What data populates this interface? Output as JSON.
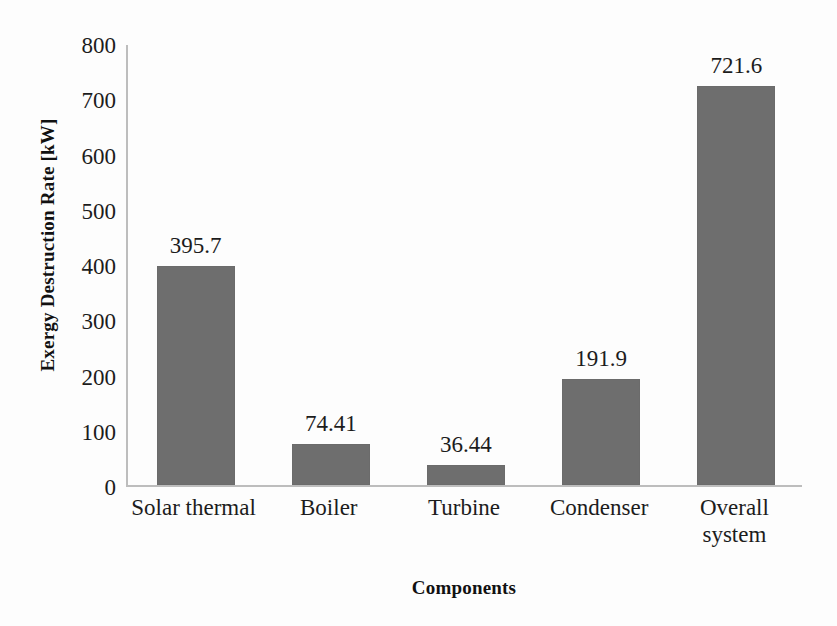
{
  "chart_data": {
    "type": "bar",
    "title": "",
    "subtitle": "",
    "xlabel": "Components",
    "ylabel": "Exergy Destruction Rate [kW]",
    "categories": [
      "Solar thermal",
      "Boiler",
      "Turbine",
      "Condenser",
      "Overall system"
    ],
    "values": [
      395.7,
      74.41,
      36.44,
      191.9,
      721.6
    ],
    "value_labels": [
      "395.7",
      "74.41",
      "36.44",
      "191.9",
      "721.6"
    ],
    "series": [
      {
        "name": "Exergy Destruction Rate",
        "values": [
          395.7,
          74.41,
          36.44,
          191.9,
          721.6
        ]
      }
    ],
    "ylim": [
      0,
      800
    ],
    "ytick_values": [
      800,
      700,
      600,
      500,
      400,
      300,
      200,
      100,
      0
    ],
    "ytick_labels": [
      "800",
      "700",
      "600",
      "500",
      "400",
      "300",
      "200",
      "100",
      "0"
    ],
    "grid": false,
    "legend": false,
    "legend_position": "none",
    "bar_color": "#6e6e6e",
    "axis_color": "#bdbdbd",
    "background_color": "#fdfdfd",
    "data_labels_shown": true
  },
  "axes": {
    "y_title": "Exergy Destruction Rate [kW]",
    "x_title": "Components"
  }
}
